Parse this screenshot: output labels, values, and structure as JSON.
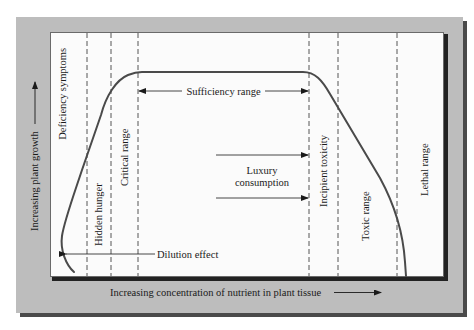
{
  "diagram": {
    "x_axis_label": "Increasing concentration of nutrient in plant tissue",
    "y_axis_label": "Increasing plant growth",
    "zones": [
      {
        "id": "deficiency",
        "label": "Deficiency symptoms"
      },
      {
        "id": "hidden-hunger",
        "label": "Hidden hunger"
      },
      {
        "id": "critical",
        "label": "Critical range"
      },
      {
        "id": "incipient-toxicity",
        "label": "Incipient toxicity"
      },
      {
        "id": "toxic",
        "label": "Toxic range"
      },
      {
        "id": "lethal",
        "label": "Lethal range"
      }
    ],
    "annotations": {
      "sufficiency": "Sufficiency range",
      "luxury_line1": "Luxury",
      "luxury_line2": "consumption",
      "dilution": "Dilution effect"
    },
    "colors": {
      "outer_frame": "#bdbdbd",
      "panel": "#fbfbfb",
      "curve": "#4a4a4a",
      "dash": "#555555",
      "text": "#1a1a1a"
    }
  }
}
